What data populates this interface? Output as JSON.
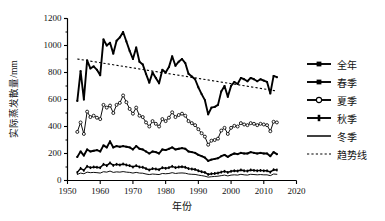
{
  "chart_data": {
    "type": "line",
    "title": "",
    "xlabel": "年份",
    "ylabel": "实际蒸发散量/mm",
    "xlim": [
      1950,
      2020
    ],
    "ylim": [
      0,
      1200
    ],
    "xticks": [
      1950,
      1960,
      1970,
      1980,
      1990,
      2000,
      2010,
      2020
    ],
    "yticks": [
      0,
      200,
      400,
      600,
      800,
      1000,
      1200
    ],
    "ytick_minor_step": 100,
    "grid": false,
    "legend_position": "right",
    "x": [
      1953,
      1954,
      1955,
      1956,
      1957,
      1958,
      1959,
      1960,
      1961,
      1962,
      1963,
      1964,
      1965,
      1966,
      1967,
      1968,
      1969,
      1970,
      1971,
      1972,
      1973,
      1974,
      1975,
      1976,
      1977,
      1978,
      1979,
      1980,
      1981,
      1982,
      1983,
      1984,
      1985,
      1986,
      1987,
      1988,
      1989,
      1990,
      1991,
      1992,
      1993,
      1994,
      1995,
      1996,
      1997,
      1998,
      1999,
      2000,
      2001,
      2002,
      2003,
      2004,
      2005,
      2006,
      2007,
      2008,
      2009,
      2010,
      2011,
      2012,
      2013,
      2014
    ],
    "series": [
      {
        "name": "全年",
        "marker": "filled-square",
        "line": "solid-thick",
        "values": [
          590,
          810,
          600,
          890,
          830,
          845,
          820,
          780,
          1045,
          1000,
          1020,
          940,
          1035,
          1060,
          1100,
          1030,
          960,
          900,
          985,
          880,
          860,
          790,
          725,
          800,
          760,
          720,
          820,
          800,
          840,
          920,
          850,
          880,
          900,
          870,
          790,
          770,
          750,
          690,
          640,
          595,
          490,
          540,
          545,
          560,
          660,
          700,
          620,
          700,
          730,
          715,
          760,
          750,
          735,
          760,
          750,
          735,
          750,
          740,
          730,
          645,
          775,
          765
        ]
      },
      {
        "name": "春季",
        "marker": "filled-square",
        "line": "solid-thick",
        "values": [
          175,
          215,
          185,
          230,
          215,
          220,
          225,
          215,
          260,
          245,
          290,
          245,
          255,
          250,
          255,
          250,
          245,
          230,
          255,
          235,
          230,
          215,
          200,
          215,
          210,
          200,
          230,
          225,
          235,
          245,
          230,
          235,
          240,
          235,
          215,
          210,
          205,
          190,
          180,
          170,
          145,
          155,
          160,
          165,
          180,
          190,
          175,
          190,
          200,
          195,
          205,
          200,
          200,
          210,
          205,
          200,
          205,
          200,
          200,
          180,
          210,
          195
        ]
      },
      {
        "name": "夏季",
        "marker": "open-circle",
        "line": "solid-thin",
        "values": [
          360,
          430,
          345,
          510,
          470,
          480,
          465,
          455,
          560,
          540,
          555,
          500,
          560,
          575,
          630,
          580,
          530,
          495,
          540,
          480,
          470,
          430,
          400,
          440,
          420,
          400,
          455,
          440,
          465,
          505,
          470,
          485,
          495,
          480,
          440,
          425,
          410,
          380,
          350,
          325,
          265,
          295,
          300,
          310,
          370,
          390,
          345,
          390,
          405,
          400,
          425,
          415,
          410,
          425,
          420,
          410,
          420,
          415,
          410,
          365,
          435,
          430
        ]
      },
      {
        "name": "秋季",
        "marker": "filled-plus",
        "line": "solid-medium",
        "values": [
          60,
          90,
          75,
          105,
          95,
          100,
          98,
          95,
          120,
          110,
          130,
          112,
          120,
          115,
          122,
          115,
          110,
          100,
          110,
          100,
          98,
          88,
          78,
          88,
          85,
          80,
          95,
          90,
          95,
          105,
          95,
          100,
          102,
          98,
          88,
          85,
          82,
          72,
          65,
          60,
          45,
          50,
          52,
          55,
          62,
          68,
          60,
          68,
          72,
          70,
          78,
          72,
          70,
          78,
          75,
          72,
          75,
          72,
          72,
          62,
          80,
          78
        ]
      },
      {
        "name": "冬季",
        "marker": "none",
        "line": "solid-thin",
        "values": [
          45,
          55,
          50,
          62,
          58,
          60,
          58,
          55,
          65,
          62,
          70,
          60,
          64,
          62,
          66,
          62,
          60,
          55,
          60,
          55,
          54,
          48,
          44,
          48,
          46,
          44,
          52,
          50,
          52,
          58,
          52,
          55,
          56,
          54,
          48,
          46,
          45,
          40,
          36,
          32,
          25,
          28,
          30,
          32,
          36,
          40,
          34,
          40,
          42,
          40,
          46,
          42,
          40,
          46,
          44,
          42,
          44,
          42,
          42,
          36,
          48,
          46
        ]
      }
    ],
    "trendline": {
      "name": "趋势线",
      "style": "dotted",
      "x_start": 1953,
      "y_start": 900,
      "x_end": 2014,
      "y_end": 663
    }
  },
  "legend": {
    "items": [
      {
        "label": "全年",
        "marker": "filled-square"
      },
      {
        "label": "春季",
        "marker": "filled-square"
      },
      {
        "label": "夏季",
        "marker": "open-circle"
      },
      {
        "label": "秋季",
        "marker": "filled-plus"
      },
      {
        "label": "冬季",
        "marker": "plain-line"
      },
      {
        "label": "趋势线",
        "marker": "dotted-line"
      }
    ]
  },
  "axis": {
    "y_title": "实际蒸发散量/mm",
    "x_title": "年份",
    "y_tick_labels": [
      "1200",
      "1000",
      "800",
      "600",
      "400",
      "200",
      "0"
    ],
    "x_tick_labels": [
      "1950",
      "1960",
      "1970",
      "1980",
      "1990",
      "2000",
      "2010",
      "2020"
    ]
  },
  "colors": {
    "line": "#000000",
    "background": "#ffffff",
    "text": "#111111"
  }
}
